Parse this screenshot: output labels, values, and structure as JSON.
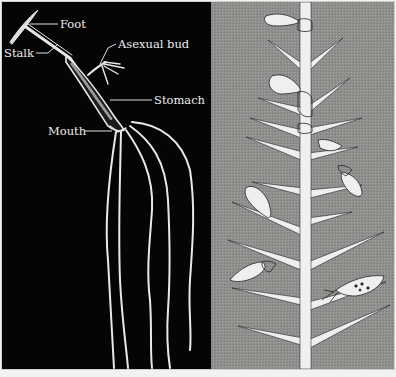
{
  "figure": {
    "left_panel": {
      "background": "#050505",
      "subject": "hydra anatomy",
      "labels": [
        {
          "text": "Foot",
          "x": 60,
          "y": 28
        },
        {
          "text": "Asexual bud",
          "x": 118,
          "y": 48
        },
        {
          "text": "Stalk",
          "x": 4,
          "y": 57
        },
        {
          "text": "Stomach",
          "x": 154,
          "y": 104
        },
        {
          "text": "Mouth",
          "x": 48,
          "y": 135
        }
      ]
    },
    "right_panel": {
      "background": "#8f8f8d",
      "subject": "hydras attached to a spiny plant stem"
    }
  }
}
